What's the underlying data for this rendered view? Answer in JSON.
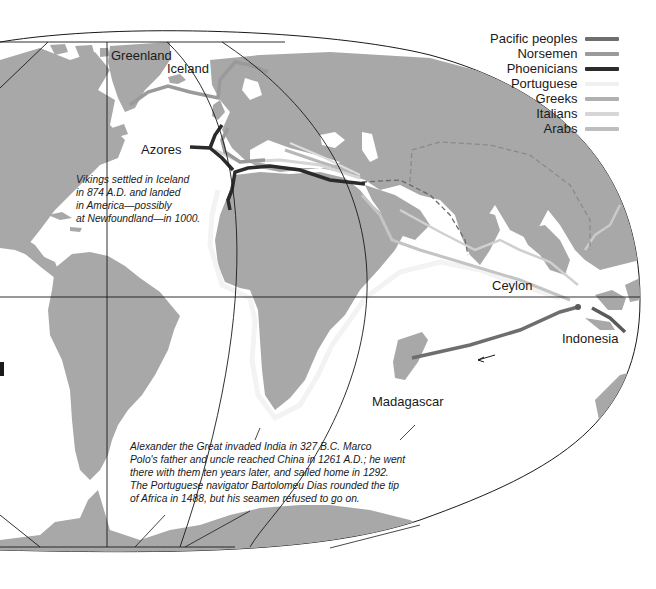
{
  "map": {
    "title": "Early sea voyages of exploration and trade",
    "background": "#ffffff",
    "land_color": "#a8a8a8",
    "sea_color": "#ffffff",
    "grid_color": "#1a1a1a"
  },
  "legend": {
    "items": [
      {
        "label": "Pacific peoples",
        "color": "#6e6e6e"
      },
      {
        "label": "Norsemen",
        "color": "#9a9a9a"
      },
      {
        "label": "Phoenicians",
        "color": "#2b2b2b"
      },
      {
        "label": "Portuguese",
        "color": "#f0f0f0"
      },
      {
        "label": "Greeks",
        "color": "#b0b0b0"
      },
      {
        "label": "Italians",
        "color": "#d6d6d6"
      },
      {
        "label": "Arabs",
        "color": "#bdbdbd"
      }
    ]
  },
  "places": {
    "greenland": "Greenland",
    "iceland": "Iceland",
    "azores": "Azores",
    "ceylon": "Ceylon",
    "indonesia": "Indonesia",
    "madagascar": "Madagascar"
  },
  "notes": {
    "vikings": [
      "Vikings settled in Iceland",
      "in 874 A.D. and landed",
      "in America—possibly",
      "at Newfoundland—in 1000."
    ],
    "explorers": [
      "Alexander the Great invaded India in 327 B.C. Marco",
      "Polo's father and uncle reached China in 1261 A.D.; he went",
      "there with them ten years later, and sailed home in 1292.",
      "The Portuguese navigator Bartolomeu Dias rounded the tip",
      "of Africa in 1488, but his seamen refused to go on."
    ]
  }
}
